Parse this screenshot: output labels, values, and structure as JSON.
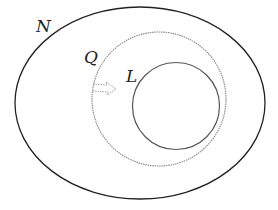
{
  "diagram": {
    "type": "venn-nested-sets",
    "sets": [
      {
        "label": "N",
        "shape": "ellipse",
        "stroke": "#222222"
      },
      {
        "label": "Q",
        "shape": "circle",
        "stroke": "#777777"
      },
      {
        "label": "L",
        "shape": "circle",
        "stroke": "#555555"
      }
    ],
    "relations": [
      "L ⊂ Q ⊂ N"
    ],
    "arrow": {
      "style": "dashed",
      "direction": "right",
      "color": "#999999"
    }
  }
}
